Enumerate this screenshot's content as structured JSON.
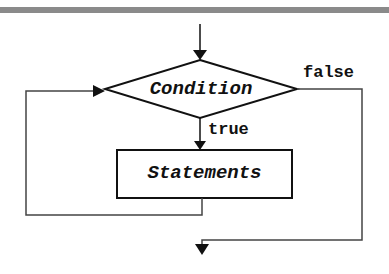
{
  "diagram": {
    "type": "flowchart",
    "nodes": {
      "condition": {
        "shape": "diamond",
        "label": "Condition"
      },
      "statements": {
        "shape": "rectangle",
        "label": "Statements"
      }
    },
    "edges": {
      "true_label": "true",
      "false_label": "false"
    },
    "colors": {
      "line": "#111111",
      "loop_line": "#444444",
      "top_bar": "#8a8a8a",
      "background": "#ffffff"
    }
  }
}
